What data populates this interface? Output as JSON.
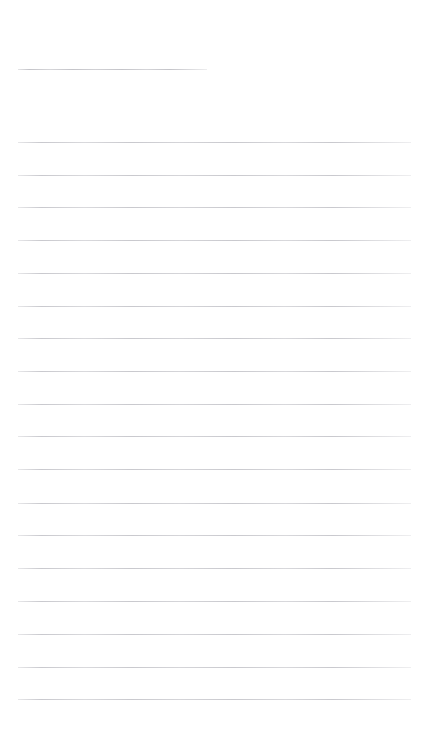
{
  "page": {
    "kind": "lined-notepaper",
    "title_text": "",
    "background_color": "#ffffff",
    "rule_color": "#c9c9ce",
    "width_px": 432,
    "height_px": 749
  },
  "header_rule": {
    "name": "title-blank-rule",
    "label_text": "",
    "x": 18,
    "y": 69,
    "width": 189
  },
  "body_rules": [
    {
      "index": 1,
      "y": 142,
      "x": 18,
      "width": 393,
      "text": ""
    },
    {
      "index": 2,
      "y": 175,
      "x": 18,
      "width": 393,
      "text": ""
    },
    {
      "index": 3,
      "y": 207,
      "x": 18,
      "width": 393,
      "text": ""
    },
    {
      "index": 4,
      "y": 240,
      "x": 18,
      "width": 393,
      "text": ""
    },
    {
      "index": 5,
      "y": 273,
      "x": 18,
      "width": 393,
      "text": ""
    },
    {
      "index": 6,
      "y": 306,
      "x": 18,
      "width": 393,
      "text": ""
    },
    {
      "index": 7,
      "y": 338,
      "x": 18,
      "width": 393,
      "text": ""
    },
    {
      "index": 8,
      "y": 371,
      "x": 18,
      "width": 393,
      "text": ""
    },
    {
      "index": 9,
      "y": 404,
      "x": 18,
      "width": 393,
      "text": ""
    },
    {
      "index": 10,
      "y": 436,
      "x": 18,
      "width": 393,
      "text": ""
    },
    {
      "index": 11,
      "y": 469,
      "x": 18,
      "width": 393,
      "text": ""
    },
    {
      "index": 12,
      "y": 503,
      "x": 18,
      "width": 393,
      "text": ""
    },
    {
      "index": 13,
      "y": 535,
      "x": 18,
      "width": 393,
      "text": ""
    },
    {
      "index": 14,
      "y": 568,
      "x": 18,
      "width": 393,
      "text": ""
    },
    {
      "index": 15,
      "y": 601,
      "x": 18,
      "width": 393,
      "text": ""
    },
    {
      "index": 16,
      "y": 634,
      "x": 18,
      "width": 393,
      "text": ""
    },
    {
      "index": 17,
      "y": 667,
      "x": 18,
      "width": 393,
      "text": ""
    },
    {
      "index": 18,
      "y": 699,
      "x": 18,
      "width": 393,
      "text": ""
    }
  ]
}
